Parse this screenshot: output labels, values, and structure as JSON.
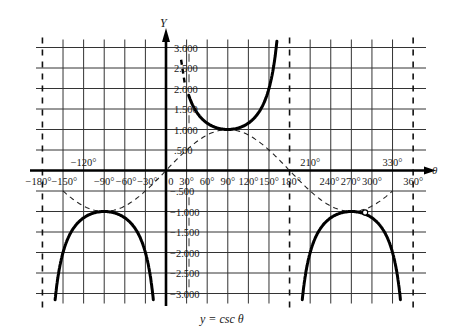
{
  "chart_data": {
    "type": "line",
    "title": "y = csc θ",
    "caption": "y = csc θ",
    "xlabel": "θ",
    "ylabel": "Y",
    "xunit": "degrees",
    "xlim": [
      -180,
      360
    ],
    "ylim": [
      -3,
      3
    ],
    "grid": true,
    "x_tick_labels_below": [
      "−180°",
      "−150°",
      "−90°",
      "−60°",
      "−30°",
      "0",
      "30°",
      "60°",
      "90°",
      "120°",
      "150°",
      "180°",
      "240°",
      "270°",
      "300°",
      "360°"
    ],
    "x_tick_labels_above": [
      "−120°",
      "210°",
      "330°"
    ],
    "y_tick_labels": [
      ".500",
      "1.000",
      "1.500",
      "2.000",
      "2.500",
      "3.000",
      "−.500",
      "−1.000",
      "−1.500",
      "−2.000",
      "−2.500",
      "−3.000"
    ],
    "y_ticks": [
      3.0,
      2.5,
      2.0,
      1.5,
      1.0,
      0.5,
      -0.5,
      -1.0,
      -1.5,
      -2.0,
      -2.5,
      -3.0
    ],
    "x_grid": [
      -150,
      -120,
      -90,
      -60,
      -30,
      30,
      60,
      90,
      120,
      150,
      210,
      240,
      270,
      300,
      330
    ],
    "asymptotes": [
      -180,
      180,
      360
    ],
    "series": [
      {
        "name": "y = csc θ",
        "style": "solid-thick",
        "branches": [
          {
            "x": [
              -165,
              -150,
              -135,
              -120,
              -105,
              -90,
              -75,
              -60,
              -45,
              -30,
              -15
            ],
            "y": [
              -3.86,
              -2.0,
              -1.414,
              -1.155,
              -1.035,
              -1.0,
              -1.035,
              -1.155,
              -1.414,
              -2.0,
              -3.86
            ]
          },
          {
            "x": [
              30,
              45,
              60,
              75,
              90,
              105,
              120,
              135,
              150,
              160
            ],
            "y": [
              2.0,
              1.414,
              1.155,
              1.035,
              1.0,
              1.035,
              1.155,
              1.414,
              2.0,
              2.92
            ]
          },
          {
            "x": [
              195,
              210,
              225,
              240,
              255,
              270,
              285,
              300,
              315,
              330,
              345
            ],
            "y": [
              -3.86,
              -2.0,
              -1.414,
              -1.155,
              -1.035,
              -1.0,
              -1.035,
              -1.155,
              -1.414,
              -2.0,
              -3.86
            ]
          }
        ]
      },
      {
        "name": "y = sin θ (reference)",
        "style": "dashed",
        "x_range": [
          -150,
          330
        ],
        "y_of": "sin"
      }
    ],
    "annotations": [
      {
        "type": "open-circle",
        "x": 290,
        "y": -0.94
      }
    ]
  },
  "labels": {
    "y_axis": "Y",
    "x_axis": "θ",
    "caption": "y = csc θ"
  }
}
